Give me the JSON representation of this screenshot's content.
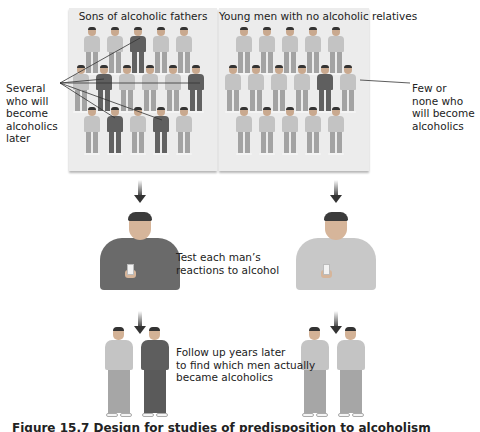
{
  "panels": {
    "left": {
      "title": "Sons of alcoholic fathers",
      "rows": [
        [
          "light",
          "light",
          "dark",
          "light",
          "light"
        ],
        [
          "light",
          "dark",
          "light",
          "light",
          "light",
          "dark"
        ],
        [
          "light",
          "dark",
          "light",
          "dark",
          "light"
        ]
      ]
    },
    "right": {
      "title": "Young men with no alcoholic relatives",
      "rows": [
        [
          "light",
          "light",
          "light",
          "light",
          "light"
        ],
        [
          "light",
          "light",
          "light",
          "light",
          "dark",
          "light"
        ],
        [
          "light",
          "light",
          "light",
          "light",
          "light"
        ]
      ]
    }
  },
  "labels": {
    "several": [
      "Several",
      "who will",
      "become",
      "alcoholics",
      "later"
    ],
    "few": [
      "Few or",
      "none who",
      "will become",
      "alcoholics"
    ]
  },
  "steps": {
    "test": [
      "Test each man’s",
      "reactions to alcohol"
    ],
    "follow": [
      "Follow up years later",
      "to find which men actually",
      "became alcoholics"
    ]
  },
  "caption": "Figure 15.7  Design for studies of predisposition to alcoholism",
  "colors": {
    "panel_bg": "#ececec",
    "light_figure": "#c3c3c3",
    "dark_figure": "#5f5f5f",
    "text": "#222222"
  }
}
